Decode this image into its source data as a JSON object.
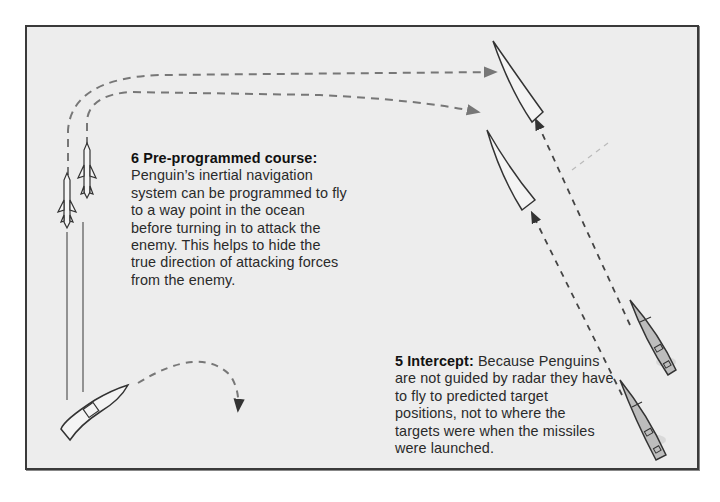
{
  "diagram": {
    "background_color": "#ededed",
    "border_color": "#3a3a3a",
    "path_color": "#777777",
    "outline_color": "#333333",
    "elements": {
      "missiles": [
        {
          "name": "penguin-missile-1",
          "x": 67,
          "y": 200
        },
        {
          "name": "penguin-missile-2",
          "x": 87,
          "y": 170
        }
      ],
      "launch_vessel": {
        "name": "launch-boat",
        "x": 85,
        "y": 385
      },
      "target_ships_predicted": [
        {
          "name": "predicted-target-1",
          "x": 515,
          "y": 85
        },
        {
          "name": "predicted-target-2",
          "x": 510,
          "y": 165
        }
      ],
      "target_ships_actual": [
        {
          "name": "actual-target-1",
          "x": 655,
          "y": 345
        },
        {
          "name": "actual-target-2",
          "x": 650,
          "y": 420
        }
      ]
    }
  },
  "captions": {
    "six": {
      "title": "6 Pre-programmed course:",
      "lines": [
        "Penguin’s inertial navigation",
        "system can be programmed to fly",
        "to a way point in the ocean",
        "before turning in to attack the",
        "enemy. This helps to hide the",
        "true direction of attacking forces",
        "from the enemy."
      ]
    },
    "five": {
      "title": "5 Intercept:",
      "first_line_rest": " Because Penguins",
      "lines": [
        "are not guided by radar they have",
        "to fly to predicted target",
        "positions, not to where the",
        "targets were when the missiles",
        "were launched."
      ]
    }
  }
}
